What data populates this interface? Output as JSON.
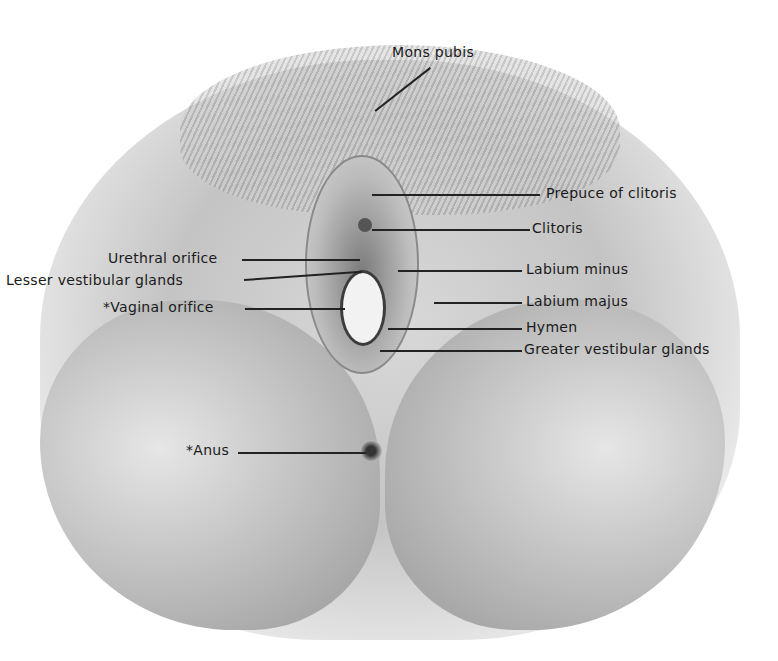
{
  "figure": {
    "labels": {
      "mons_pubis": "Mons pubis",
      "prepuce_of_clitoris": "Prepuce of clitoris",
      "clitoris": "Clitoris",
      "labium_minus": "Labium minus",
      "labium_majus": "Labium majus",
      "hymen": "Hymen",
      "greater_vestibular_glands": "Greater vestibular glands",
      "urethral_orifice": "Urethral orifice",
      "lesser_vestibular_glands": "Lesser vestibular glands",
      "vaginal_orifice": "*Vaginal orifice",
      "anus": "*Anus"
    }
  }
}
